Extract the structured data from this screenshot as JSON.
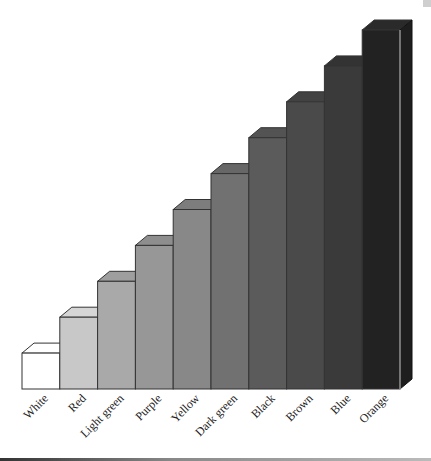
{
  "chart_data": {
    "type": "bar",
    "style": "3d-staircase",
    "title": "",
    "xlabel": "",
    "ylabel": "",
    "grid": false,
    "legend": "none",
    "categories": [
      "White",
      "Red",
      "Light green",
      "Purple",
      "Yellow",
      "Dark green",
      "Black",
      "Brown",
      "Blue",
      "Orange"
    ],
    "values": [
      1,
      2,
      3,
      4,
      5,
      6,
      7,
      8,
      9,
      10
    ],
    "ylim": [
      0,
      10
    ],
    "colors": [
      "#ffffff",
      "#c8c8c8",
      "#a9a9a9",
      "#979797",
      "#888888",
      "#717171",
      "#5b5b5b",
      "#4a4a4a",
      "#3a3a3a",
      "#222222"
    ],
    "top_colors": [
      "#ffffff",
      "#d6d6d6",
      "#9e9e9e",
      "#8e8e8e",
      "#7d7d7d",
      "#676767",
      "#535353",
      "#424242",
      "#333333",
      "#2a2a2a"
    ]
  }
}
